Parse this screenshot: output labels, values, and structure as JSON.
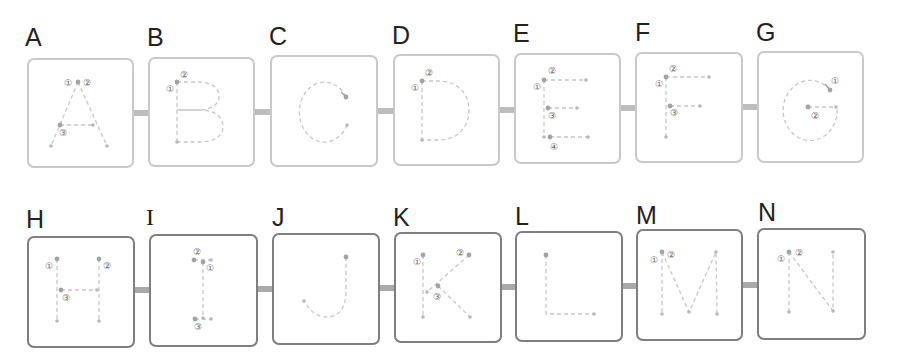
{
  "rows": [
    {
      "cards": [
        {
          "letter": "A",
          "steps": [
            "①",
            "②",
            "③"
          ]
        },
        {
          "letter": "B",
          "steps": [
            "①",
            "②"
          ]
        },
        {
          "letter": "C",
          "steps": []
        },
        {
          "letter": "D",
          "steps": [
            "①",
            "②"
          ]
        },
        {
          "letter": "E",
          "steps": [
            "①",
            "②",
            "③",
            "④"
          ]
        },
        {
          "letter": "F",
          "steps": [
            "①",
            "②",
            "③"
          ]
        },
        {
          "letter": "G",
          "steps": [
            "①",
            "②"
          ]
        }
      ]
    },
    {
      "cards": [
        {
          "letter": "H",
          "steps": [
            "①",
            "②",
            "③"
          ]
        },
        {
          "letter": "I",
          "steps": [
            "①",
            "②",
            "③"
          ]
        },
        {
          "letter": "J",
          "steps": []
        },
        {
          "letter": "K",
          "steps": [
            "①",
            "②",
            "③"
          ]
        },
        {
          "letter": "L",
          "steps": []
        },
        {
          "letter": "M",
          "steps": [
            "①",
            "②"
          ]
        },
        {
          "letter": "N",
          "steps": [
            "①",
            "②"
          ]
        }
      ]
    }
  ],
  "colors": {
    "row1_border": "#c9c9c9",
    "row2_border": "#7f7f7f",
    "trace_line": "#c8c8c8",
    "start_dot": "#a3a3a3",
    "connector_row1": "#bdbdbd",
    "connector_row2": "#a9a9a9"
  }
}
